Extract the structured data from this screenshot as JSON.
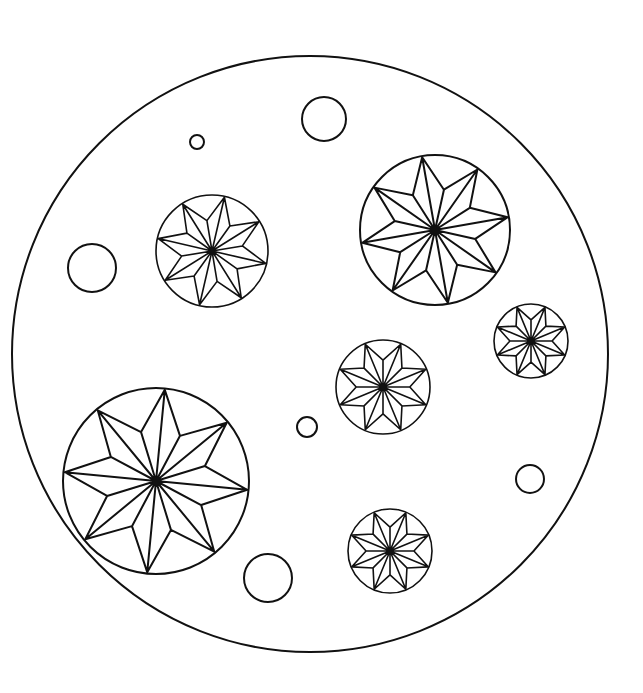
{
  "page": {
    "width": 643,
    "height": 693,
    "background": "#ffffff",
    "line_color": "#111111"
  },
  "outer_circle": {
    "cx": 310,
    "cy": 354,
    "r": 298
  },
  "star_medallions": [
    {
      "id": "star-top-left",
      "cx": 212,
      "cy": 251,
      "r": 56,
      "rotation": -32,
      "inner_ratio": 0.55
    },
    {
      "id": "star-top-right",
      "cx": 435,
      "cy": 230,
      "r": 75,
      "rotation": -10,
      "inner_ratio": 0.55
    },
    {
      "id": "star-right-small",
      "cx": 531,
      "cy": 341,
      "r": 37,
      "rotation": 22.5,
      "inner_ratio": 0.57
    },
    {
      "id": "star-middle",
      "cx": 383,
      "cy": 387,
      "r": 47,
      "rotation": 22.5,
      "inner_ratio": 0.57
    },
    {
      "id": "star-bottom-left",
      "cx": 156,
      "cy": 481,
      "r": 93,
      "rotation": 5.5,
      "inner_ratio": 0.55
    },
    {
      "id": "star-bottom",
      "cx": 390,
      "cy": 551,
      "r": 42,
      "rotation": 22.5,
      "inner_ratio": 0.57
    }
  ],
  "plain_circles": [
    {
      "id": "circle-tiny-top",
      "cx": 197,
      "cy": 142,
      "r": 7
    },
    {
      "id": "circle-top",
      "cx": 324,
      "cy": 119,
      "r": 22
    },
    {
      "id": "circle-left",
      "cx": 92,
      "cy": 268,
      "r": 24
    },
    {
      "id": "circle-small-center",
      "cx": 307,
      "cy": 427,
      "r": 10
    },
    {
      "id": "circle-small-right",
      "cx": 530,
      "cy": 479,
      "r": 14
    },
    {
      "id": "circle-bottom",
      "cx": 268,
      "cy": 578,
      "r": 24
    }
  ]
}
